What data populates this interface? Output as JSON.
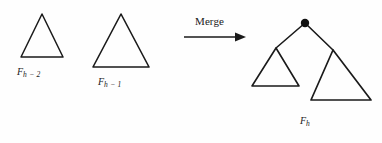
{
  "figure": {
    "kind": "diagram",
    "background_color": "#fefefe",
    "stroke_color": "#1a1a1a"
  },
  "operation": {
    "label": "Merge",
    "arrow": "arrow-right"
  },
  "shapes": {
    "left_triangle": {
      "label_base": "F",
      "label_sub": "h − 2",
      "apex": [
        42,
        14
      ],
      "base_left": [
        21,
        57
      ],
      "base_right": [
        63,
        57
      ]
    },
    "middle_triangle": {
      "label_base": "F",
      "label_sub": "h − 1",
      "apex": [
        121,
        14
      ],
      "base_left": [
        93,
        67
      ],
      "base_right": [
        149,
        67
      ]
    },
    "result_tree": {
      "label_base": "F",
      "label_sub": "h",
      "root_node": [
        305,
        23
      ],
      "root_radius": 4,
      "left_child_triangle": {
        "apex": [
          276,
          48
        ],
        "base_left": [
          252,
          86
        ],
        "base_right": [
          299,
          86
        ]
      },
      "right_child_triangle": {
        "apex": [
          333,
          50
        ],
        "base_left": [
          311,
          100
        ],
        "base_right": [
          371,
          100
        ]
      }
    }
  },
  "arrow": {
    "start": [
      184,
      37
    ],
    "end": [
      246,
      37
    ]
  }
}
